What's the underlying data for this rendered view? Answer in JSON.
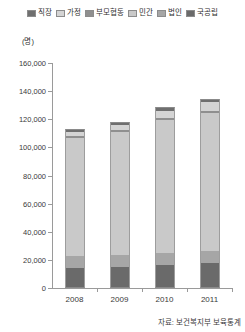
{
  "legend": {
    "position": "top",
    "items": [
      {
        "label": "직장",
        "color": "#6f6f6f"
      },
      {
        "label": "가정",
        "color": "#d4d4d4"
      },
      {
        "label": "부모협동",
        "color": "#8f8f8f"
      },
      {
        "label": "민간",
        "color": "#c9c9c9"
      },
      {
        "label": "법인",
        "color": "#a6a6a6"
      },
      {
        "label": "국공립",
        "color": "#6a6a6a"
      }
    ]
  },
  "axes": {
    "y_unit": "(명)",
    "y_ticks": [
      "160,000",
      "140,000",
      "120,000",
      "100,000",
      "80,000",
      "60,000",
      "40,000",
      "20,000",
      "0"
    ],
    "x_ticks": [
      "2008",
      "2009",
      "2010",
      "2011"
    ]
  },
  "source": "자료: 보건복지부 보육통계",
  "chart_data": {
    "type": "bar",
    "title": "",
    "subtitle": "",
    "stacked": true,
    "xlabel": "",
    "ylabel": "(명)",
    "ylim": [
      0,
      160000
    ],
    "ytick_step": 20000,
    "grid": false,
    "legend_position": "top",
    "categories": [
      "2008",
      "2009",
      "2010",
      "2011"
    ],
    "series": [
      {
        "name": "국공립",
        "color": "#6a6a6a",
        "values": [
          14000,
          15000,
          16500,
          17500
        ]
      },
      {
        "name": "법인",
        "color": "#a6a6a6",
        "values": [
          8500,
          8500,
          8500,
          8500
        ]
      },
      {
        "name": "민간",
        "color": "#c9c9c9",
        "values": [
          84000,
          87500,
          94500,
          98500
        ]
      },
      {
        "name": "부모협동",
        "color": "#8f8f8f",
        "values": [
          1500,
          1500,
          1500,
          1500
        ]
      },
      {
        "name": "가정",
        "color": "#d4d4d4",
        "values": [
          3000,
          3500,
          5000,
          6000
        ]
      },
      {
        "name": "직장",
        "color": "#6f6f6f",
        "values": [
          2000,
          2000,
          2500,
          2500
        ]
      }
    ],
    "totals": [
      113000,
      118000,
      128500,
      134500
    ]
  }
}
